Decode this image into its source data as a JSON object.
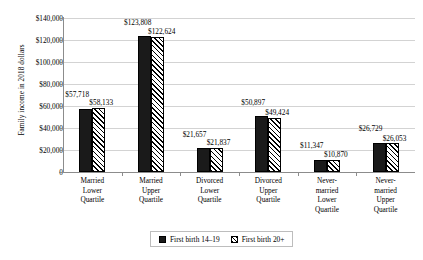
{
  "chart_data": {
    "type": "bar",
    "title": "",
    "xlabel": "",
    "ylabel": "Family income in 2018 dollars",
    "ylim": [
      0,
      140000
    ],
    "ytick_labels": [
      "$140,000",
      "$120,000",
      "$100,000",
      "$80,000",
      "$60,000",
      "$40,000",
      "$20,000",
      "0"
    ],
    "ytick_values": [
      140000,
      120000,
      100000,
      80000,
      60000,
      40000,
      20000,
      0
    ],
    "grid": true,
    "legend_position": "bottom",
    "categories": [
      [
        "Married",
        "Lower",
        "Quartile"
      ],
      [
        "Married",
        "Upper",
        "Quartile"
      ],
      [
        "Divorced",
        "Lower",
        "Quartile"
      ],
      [
        "Divorced",
        "Upper",
        "Quartile"
      ],
      [
        "Never-",
        "married",
        "Lower",
        "Quartile"
      ],
      [
        "Never-",
        "married",
        "Upper",
        "Quartile"
      ]
    ],
    "series": [
      {
        "name": "First birth 14–19",
        "color": "#1a1a1a",
        "values": [
          57718,
          123808,
          21657,
          50897,
          11347,
          26729
        ],
        "labels": [
          "$57,718",
          "$123,808",
          "$21,657",
          "$50,897",
          "$11,347",
          "$26,729"
        ]
      },
      {
        "name": "First birth 20+",
        "color": "#ffffff",
        "pattern": "diagonal-hatch",
        "values": [
          58133,
          122624,
          21837,
          49424,
          10870,
          26053
        ],
        "labels": [
          "$58,133",
          "$122,624",
          "$21,837",
          "$49,424",
          "$10,870",
          "$26,053"
        ]
      }
    ]
  }
}
